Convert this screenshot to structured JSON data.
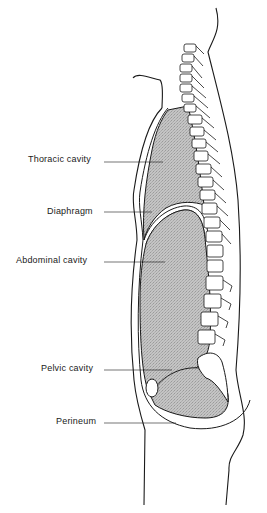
{
  "diagram": {
    "labels": [
      {
        "id": "thoracic",
        "text": "Thoracic cavity",
        "x": 28,
        "y": 154
      },
      {
        "id": "diaphragm",
        "text": "Diaphragm",
        "x": 47,
        "y": 206
      },
      {
        "id": "abdominal",
        "text": "Abdominal cavity",
        "x": 16,
        "y": 255
      },
      {
        "id": "pelvic",
        "text": "Pelvic cavity",
        "x": 41,
        "y": 363
      },
      {
        "id": "perineum",
        "text": "Perineum",
        "x": 56,
        "y": 416
      }
    ],
    "colors": {
      "line": "#1a1a1a",
      "cavity_fill": "#bdbdbd",
      "background": "#ffffff"
    }
  }
}
